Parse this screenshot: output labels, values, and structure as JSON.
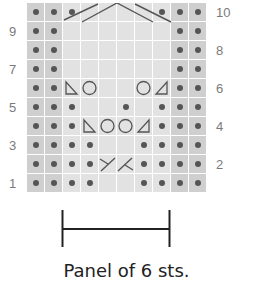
{
  "caption": "Panel of 6 sts.",
  "row_numbers_left": [
    {
      "label": "9",
      "row": 9
    },
    {
      "label": "7",
      "row": 7
    },
    {
      "label": "5",
      "row": 5
    },
    {
      "label": "3",
      "row": 3
    },
    {
      "label": "1",
      "row": 1
    }
  ],
  "row_numbers_right": [
    {
      "label": "10",
      "row": 10
    },
    {
      "label": "8",
      "row": 8
    },
    {
      "label": "6",
      "row": 6
    },
    {
      "label": "4",
      "row": 4
    },
    {
      "label": "2",
      "row": 2
    }
  ],
  "colors": {
    "edge_cell": "#cfcfcf",
    "center_cell": "#e2e2e2",
    "symbol": "#555555",
    "row_number": "#7a7a7a",
    "caption": "#222222"
  },
  "grid": {
    "columns": 10,
    "rows": 10,
    "panel_columns": [
      3,
      8
    ],
    "legend": {
      "dot": "purl",
      "blank": "knit",
      "circle": "yarn-over",
      "tri_left": "ssk",
      "tri_right": "k2tog",
      "cross_left": "1/1 cross left",
      "cross_right": "1/1 cross right",
      "cable": "cable cross"
    },
    "rows_top_to_bottom": [
      {
        "row": 10,
        "cells": [
          "dot",
          "dot",
          "dot",
          "blank",
          "blank",
          "blank",
          "blank",
          "dot",
          "dot",
          "dot"
        ],
        "cable": true
      },
      {
        "row": 9,
        "cells": [
          "dot",
          "dot",
          "blank",
          "blank",
          "blank",
          "blank",
          "blank",
          "blank",
          "dot",
          "dot"
        ]
      },
      {
        "row": 8,
        "cells": [
          "dot",
          "dot",
          "blank",
          "blank",
          "blank",
          "blank",
          "blank",
          "blank",
          "dot",
          "dot"
        ]
      },
      {
        "row": 7,
        "cells": [
          "dot",
          "dot",
          "blank",
          "blank",
          "blank",
          "blank",
          "blank",
          "blank",
          "dot",
          "dot"
        ]
      },
      {
        "row": 6,
        "cells": [
          "dot",
          "dot",
          "tri_left",
          "circle",
          "blank",
          "blank",
          "circle",
          "tri_right",
          "dot",
          "dot"
        ]
      },
      {
        "row": 5,
        "cells": [
          "dot",
          "dot",
          "dot",
          "blank",
          "blank",
          "dot",
          "blank",
          "dot",
          "dot",
          "dot"
        ]
      },
      {
        "row": 4,
        "cells": [
          "dot",
          "dot",
          "dot",
          "tri_left",
          "circle",
          "circle",
          "tri_right",
          "dot",
          "dot",
          "dot"
        ]
      },
      {
        "row": 3,
        "cells": [
          "dot",
          "dot",
          "dot",
          "dot",
          "blank",
          "blank",
          "dot",
          "dot",
          "dot",
          "dot"
        ]
      },
      {
        "row": 2,
        "cells": [
          "dot",
          "dot",
          "dot",
          "dot",
          "cross_left",
          "cross_right",
          "dot",
          "dot",
          "dot",
          "dot"
        ]
      },
      {
        "row": 1,
        "cells": [
          "dot",
          "dot",
          "dot",
          "dot",
          "blank",
          "blank",
          "dot",
          "dot",
          "dot",
          "dot"
        ]
      }
    ]
  }
}
